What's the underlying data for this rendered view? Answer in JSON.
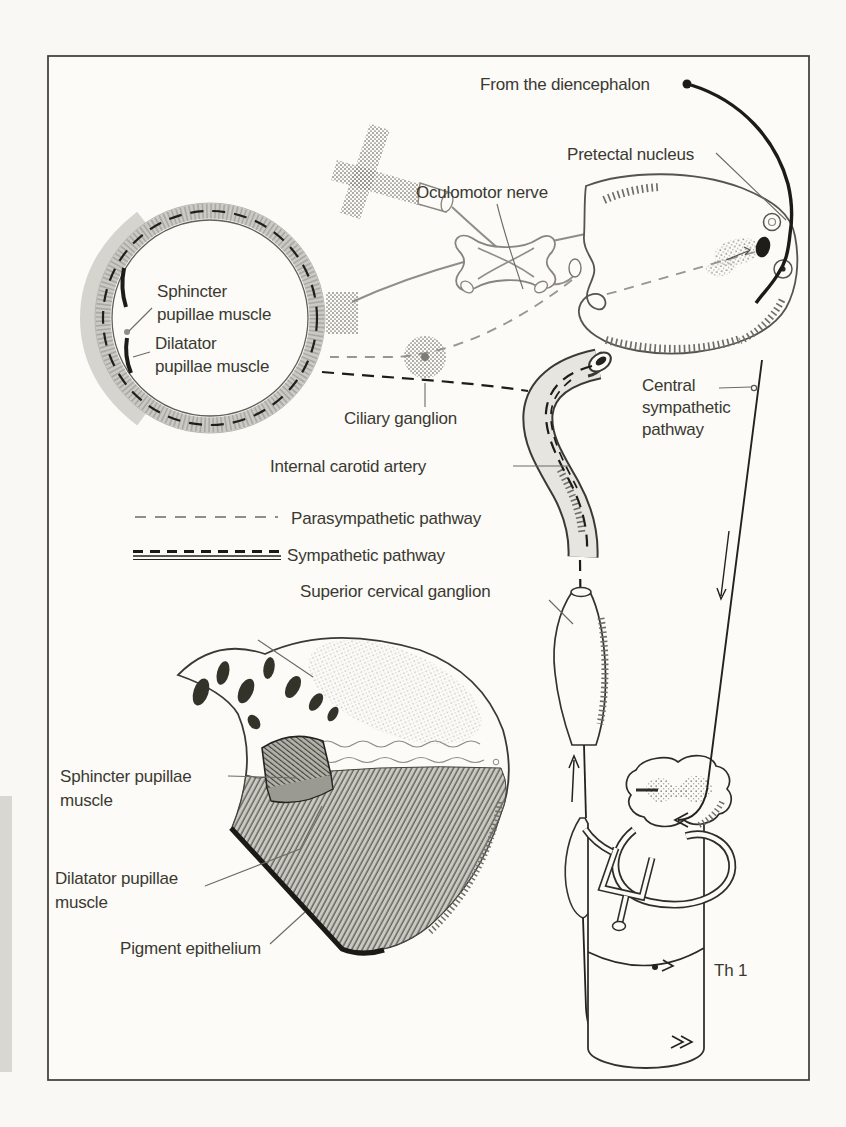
{
  "figure": {
    "type": "anatomical-pathway-diagram",
    "labels": {
      "from_diencephalon": "From the diencephalon",
      "pretectal_nucleus": "Pretectal nucleus",
      "oculomotor_nerve": "Oculomotor nerve",
      "sphincter_eye_line1": "Sphincter",
      "sphincter_eye_line2": "pupillae muscle",
      "dilatator_eye_line1": "Dilatator",
      "dilatator_eye_line2": "pupillae muscle",
      "ciliary_ganglion": "Ciliary ganglion",
      "internal_carotid_artery": "Internal carotid artery",
      "central_line1": "Central",
      "central_line2": "sympathetic",
      "central_line3": "pathway",
      "superior_cervical_ganglion": "Superior cervical ganglion",
      "sphincter_detail_line1": "Sphincter pupillae",
      "sphincter_detail_line2": "muscle",
      "dilatator_detail_line1": "Dilatator pupillae",
      "dilatator_detail_line2": "muscle",
      "pigment_epithelium": "Pigment epithelium",
      "th1": "Th 1"
    },
    "legend": [
      {
        "label": "Parasympathetic pathway",
        "style": "dashed",
        "color": "#8f8e88"
      },
      {
        "label": "Sympathetic pathway",
        "style": "dashed-over-solid",
        "color": "#1d1c1a"
      }
    ],
    "colors": {
      "page_bg": "#f9f8f4",
      "ink": "#2b2a26",
      "gray_line": "#8f8e88",
      "stipple": "#a8a7a1",
      "frame": "#3b3a36"
    }
  }
}
